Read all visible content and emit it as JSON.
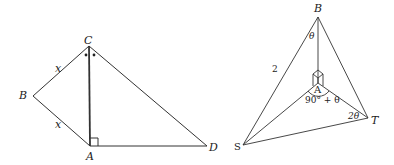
{
  "figures": [
    {
      "id": "left-figure",
      "points": {
        "C": {
          "label": "C",
          "x": 89,
          "y": 46
        },
        "B": {
          "label": "B",
          "x": 33,
          "y": 96
        },
        "A": {
          "label": "A",
          "x": 90,
          "y": 146
        },
        "D": {
          "label": "D",
          "x": 207,
          "y": 146
        }
      },
      "side_labels": {
        "CB": "x",
        "BA": "x"
      },
      "marks": {
        "right_angle_at": "A",
        "equal_angle_dots_at": "C"
      }
    },
    {
      "id": "right-figure",
      "points": {
        "B": {
          "label": "B",
          "x": 318,
          "y": 17
        },
        "A": {
          "label": "A",
          "x": 318,
          "y": 83
        },
        "S": {
          "label": "S",
          "x": 243,
          "y": 145
        },
        "T": {
          "label": "T",
          "x": 368,
          "y": 118
        }
      },
      "side_labels": {
        "BS": "2"
      },
      "angle_labels": {
        "at_B": "θ",
        "at_A": "90° + θ",
        "at_T": "2θ"
      },
      "marks": {
        "right_angle_3d_at": "A"
      }
    }
  ]
}
